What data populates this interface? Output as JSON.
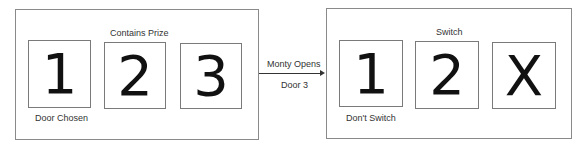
{
  "left_panel": {
    "top_label": "Contains Prize",
    "bottom_label": "Door Chosen",
    "doors": [
      "1",
      "2",
      "3"
    ]
  },
  "transition": {
    "label_top": "Monty Opens",
    "label_bottom": "Door 3"
  },
  "right_panel": {
    "top_label": "Switch",
    "bottom_label": "Don't Switch",
    "doors": [
      "1",
      "2",
      "X"
    ]
  }
}
